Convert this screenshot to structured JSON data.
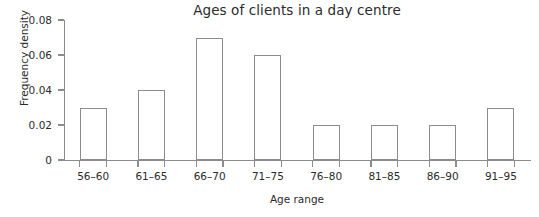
{
  "chart_data": {
    "type": "bar",
    "title": "Ages of clients in a day centre",
    "xlabel": "Age range",
    "ylabel": "Frequency density",
    "categories": [
      "56–60",
      "61–65",
      "66–70",
      "71–75",
      "76–80",
      "81–85",
      "86–90",
      "91–95"
    ],
    "values": [
      0.03,
      0.04,
      0.07,
      0.06,
      0.02,
      0.02,
      0.02,
      0.03
    ],
    "ylim": [
      0,
      0.08
    ],
    "y_ticks": [
      0,
      0.02,
      0.04,
      0.06,
      0.08
    ],
    "y_tick_labels": [
      "0",
      "0.02",
      "0.04",
      "0.06",
      "0.08"
    ],
    "grid": false,
    "legend": "none",
    "bar_fill_color": "#ffffff",
    "bar_border_color": "#8c8c8c",
    "axis_color": "#8c8c8c",
    "text_color": "#2b2b2b",
    "background_color": "#ffffff"
  }
}
